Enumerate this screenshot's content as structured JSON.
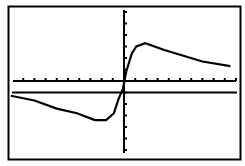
{
  "chart_data": {
    "type": "line",
    "title": "",
    "xlabel": "",
    "ylabel": "",
    "grid": false,
    "legend": null,
    "axes": {
      "x_ticks": 20,
      "y_ticks_above": 6,
      "y_ticks_below": 5
    },
    "series": [
      {
        "name": "curve",
        "x": [
          -10,
          -8,
          -6,
          -4.2,
          -2.6,
          -1.6,
          -0.9,
          -0.5,
          -0.1,
          0.2,
          0.7,
          1.1,
          1.9,
          3.6,
          5.3,
          7.0,
          9.4
        ],
        "y": [
          -1.3,
          -1.7,
          -2.4,
          -2.8,
          -3.4,
          -3.4,
          -2.8,
          -1.6,
          -0.7,
          0.8,
          2.4,
          3.0,
          3.3,
          2.7,
          2.2,
          1.7,
          1.3
        ]
      },
      {
        "name": "horizontal-line",
        "x": [
          -10,
          9.4
        ],
        "y": [
          -1.0,
          -1.0
        ]
      }
    ],
    "xlim": [
      -10,
      10
    ],
    "ylim": [
      -6,
      6
    ]
  },
  "screen": {
    "border_color": "#000000",
    "background": "#ffffff",
    "ink": "#000000"
  }
}
